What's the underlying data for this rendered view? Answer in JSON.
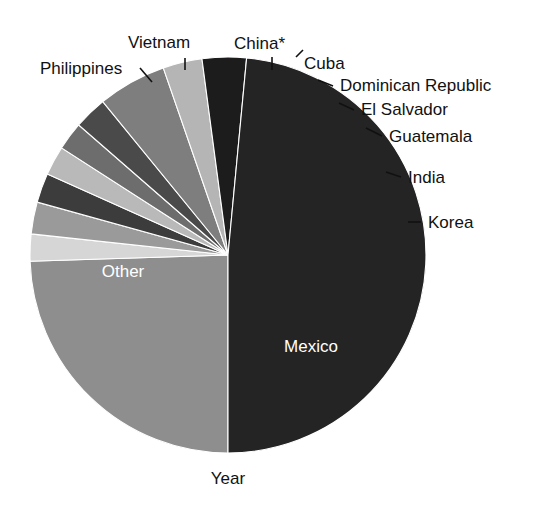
{
  "figure": {
    "background": "#ffffff",
    "axis_label": "Year",
    "width": 547,
    "height": 518
  },
  "pie": {
    "center_x": 228,
    "center_y": 255,
    "radius": 198,
    "start_angle_deg": 180,
    "direction": "clockwise"
  },
  "chart_data": {
    "type": "pie",
    "title": "",
    "xlabel": "Year",
    "ylabel": "",
    "legend": "none",
    "labels": [
      "Mexico",
      "Korea",
      "India",
      "Guatemala",
      "El Salvador",
      "Dominican Republic",
      "Cuba",
      "China*",
      "Vietnam",
      "Philippines",
      "Other"
    ],
    "values": [
      24.5,
      2.2,
      2.6,
      2.4,
      2.4,
      2.3,
      2.7,
      5.6,
      3.2,
      3.6,
      48.5
    ],
    "units": "percent",
    "colors": [
      "#8e8e8e",
      "#d6d6d6",
      "#9a9a9a",
      "#3c3c3c",
      "#b9b9b9",
      "#6d6d6d",
      "#4a4a4a",
      "#7e7e7e",
      "#b5b5b5",
      "#1c1c1c",
      "#242424"
    ],
    "annotations": [
      {
        "name": "Philippines",
        "placement": "outside-left"
      },
      {
        "name": "Vietnam",
        "placement": "outside-top"
      },
      {
        "name": "China*",
        "placement": "outside-top"
      },
      {
        "name": "Cuba",
        "placement": "outside-top-right"
      },
      {
        "name": "Dominican Republic",
        "placement": "outside-right"
      },
      {
        "name": "El Salvador",
        "placement": "outside-right"
      },
      {
        "name": "Guatemala",
        "placement": "outside-right"
      },
      {
        "name": "India",
        "placement": "outside-right"
      },
      {
        "name": "Korea",
        "placement": "outside-right"
      },
      {
        "name": "Mexico",
        "placement": "inside"
      },
      {
        "name": "Other",
        "placement": "inside"
      }
    ]
  },
  "slices": [
    {
      "name": "Mexico",
      "label": "Mexico",
      "color": "#8e8e8e",
      "value": 24.5,
      "label_mode": "inside",
      "label_x": 311,
      "label_y": 352
    },
    {
      "name": "Korea",
      "label": "Korea",
      "color": "#d6d6d6",
      "value": 2.2,
      "label_mode": "outside",
      "label_x": 428,
      "label_y": 228,
      "leader_x1": 408,
      "leader_y1": 222,
      "leader_x2": 421,
      "leader_y2": 222
    },
    {
      "name": "India",
      "label": "India",
      "color": "#9a9a9a",
      "value": 2.6,
      "label_mode": "outside",
      "label_x": 408,
      "label_y": 183,
      "leader_x1": 386,
      "leader_y1": 172,
      "leader_x2": 401,
      "leader_y2": 177
    },
    {
      "name": "Guatemala",
      "label": "Guatemala",
      "color": "#3c3c3c",
      "value": 2.4,
      "label_mode": "outside",
      "label_x": 389,
      "label_y": 142,
      "leader_x1": 366,
      "leader_y1": 128,
      "leader_x2": 382,
      "leader_y2": 136
    },
    {
      "name": "El Salvador",
      "label": "El Salvador",
      "color": "#b9b9b9",
      "value": 2.4,
      "label_mode": "outside",
      "label_x": 361,
      "label_y": 115,
      "leader_x1": 339,
      "leader_y1": 103,
      "leader_x2": 354,
      "leader_y2": 110
    },
    {
      "name": "Dominican Republic",
      "label": "Dominican Republic",
      "color": "#6d6d6d",
      "value": 2.3,
      "label_mode": "outside",
      "label_x": 340,
      "label_y": 91,
      "leader_x1": 318,
      "leader_y1": 80,
      "leader_x2": 333,
      "leader_y2": 86
    },
    {
      "name": "Cuba",
      "label": "Cuba",
      "color": "#4a4a4a",
      "value": 2.7,
      "label_mode": "outside",
      "label_x": 304,
      "label_y": 69,
      "leader_x1": 296,
      "leader_y1": 57,
      "leader_x2": 303,
      "leader_y2": 50
    },
    {
      "name": "China*",
      "label": "China*",
      "color": "#7e7e7e",
      "value": 5.6,
      "label_mode": "outside",
      "label_x": 234,
      "label_y": 49,
      "leader_x1": 272,
      "leader_y1": 57,
      "leader_x2": 272,
      "leader_y2": 70
    },
    {
      "name": "Vietnam",
      "label": "Vietnam",
      "color": "#b5b5b5",
      "value": 3.2,
      "label_mode": "outside",
      "label_x": 128,
      "label_y": 48,
      "leader_x1": 185,
      "leader_y1": 58,
      "leader_x2": 185,
      "leader_y2": 70
    },
    {
      "name": "Philippines",
      "label": "Philippines",
      "color": "#1c1c1c",
      "value": 3.6,
      "label_mode": "outside",
      "label_x": 40,
      "label_y": 74,
      "leader_x1": 140,
      "leader_y1": 68,
      "leader_x2": 152,
      "leader_y2": 82
    },
    {
      "name": "Other",
      "label": "Other",
      "color": "#242424",
      "value": 48.5,
      "label_mode": "inside",
      "label_x": 123,
      "label_y": 277
    }
  ]
}
